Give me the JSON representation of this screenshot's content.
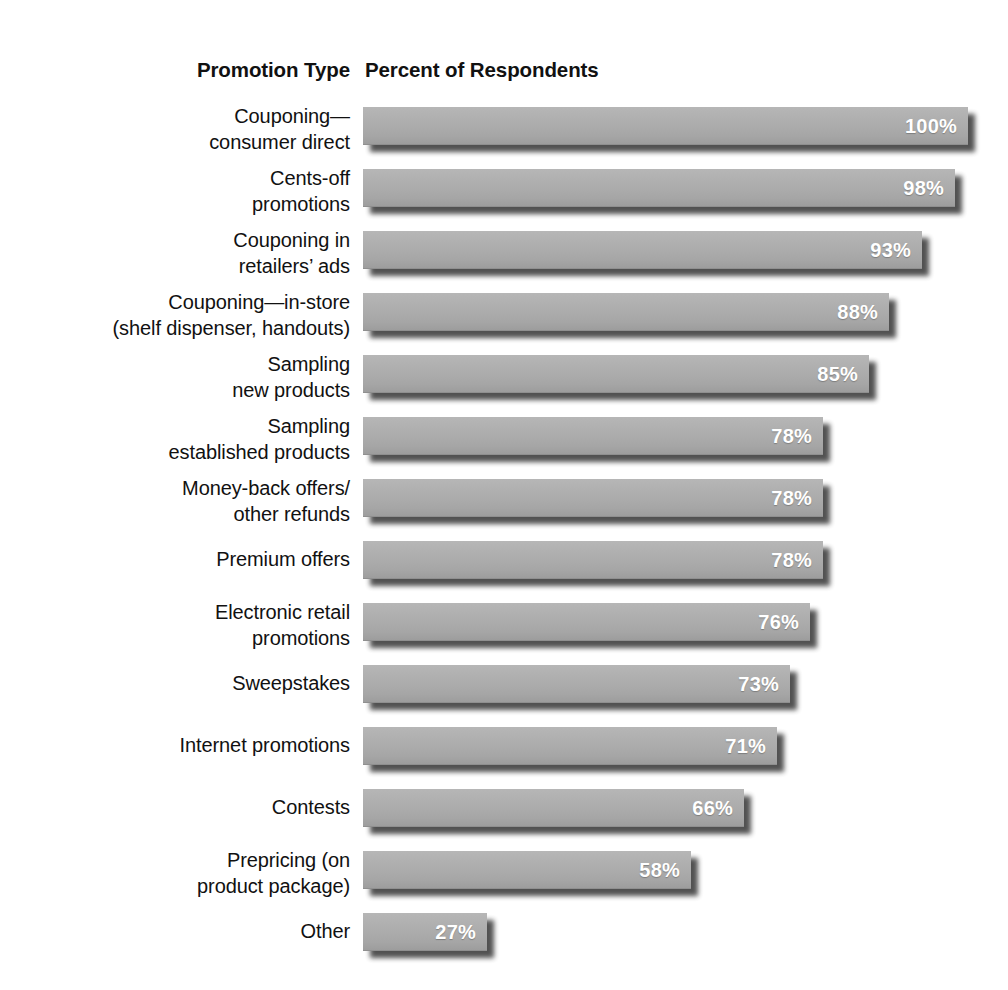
{
  "header": {
    "category_column": "Promotion Type",
    "value_column": "Percent of Respondents"
  },
  "chart_data": {
    "type": "bar",
    "orientation": "horizontal",
    "title": "",
    "subtitle": "",
    "xlabel": "Percent of Respondents",
    "ylabel": "Promotion Type",
    "xlim": [
      0,
      100
    ],
    "grid": false,
    "legend": null,
    "value_suffix": "%",
    "bar_color": "#aaaaaa",
    "value_label_color": "#ffffff",
    "categories": [
      "Couponing—consumer direct",
      "Cents-off promotions",
      "Couponing in retailers' ads",
      "Couponing—in-store (shelf dispenser, handouts)",
      "Sampling new products",
      "Sampling established products",
      "Money-back offers/other refunds",
      "Premium offers",
      "Electronic retail promotions",
      "Sweepstakes",
      "Internet promotions",
      "Contests",
      "Prepricing (on product package)",
      "Other"
    ],
    "values": [
      100,
      98,
      93,
      88,
      85,
      78,
      78,
      78,
      76,
      73,
      71,
      66,
      58,
      27
    ],
    "value_labels": [
      "100%",
      "98%",
      "93%",
      "88%",
      "85%",
      "78%",
      "78%",
      "78%",
      "76%",
      "73%",
      "71%",
      "66%",
      "58%",
      "27%"
    ]
  },
  "rows": [
    {
      "lines": [
        "Couponing—",
        "consumer direct"
      ],
      "value_label": "100%",
      "value": 100
    },
    {
      "lines": [
        "Cents-off",
        "promotions"
      ],
      "value_label": "98%",
      "value": 98
    },
    {
      "lines": [
        "Couponing in",
        "retailers’ ads"
      ],
      "value_label": "93%",
      "value": 93
    },
    {
      "lines": [
        "Couponing—in-store",
        "(shelf dispenser, handouts)"
      ],
      "value_label": "88%",
      "value": 88
    },
    {
      "lines": [
        "Sampling",
        "new products"
      ],
      "value_label": "85%",
      "value": 85
    },
    {
      "lines": [
        "Sampling",
        "established products"
      ],
      "value_label": "78%",
      "value": 78
    },
    {
      "lines": [
        "Money-back offers/",
        "other refunds"
      ],
      "value_label": "78%",
      "value": 78
    },
    {
      "lines": [
        "Premium offers"
      ],
      "value_label": "78%",
      "value": 78
    },
    {
      "lines": [
        "Electronic retail",
        "promotions"
      ],
      "value_label": "76%",
      "value": 76
    },
    {
      "lines": [
        "Sweepstakes"
      ],
      "value_label": "73%",
      "value": 73
    },
    {
      "lines": [
        "Internet promotions"
      ],
      "value_label": "71%",
      "value": 71
    },
    {
      "lines": [
        "Contests"
      ],
      "value_label": "66%",
      "value": 66
    },
    {
      "lines": [
        "Prepricing (on",
        "product package)"
      ],
      "value_label": "58%",
      "value": 58
    },
    {
      "lines": [
        "Other"
      ],
      "value_label": "27%",
      "value": 27
    }
  ],
  "layout": {
    "bar_left_px": 363,
    "bar_full_width_px": 605,
    "bar_min_width_px": 124,
    "row_pitch_px": 62,
    "first_row_top_px": 0
  }
}
